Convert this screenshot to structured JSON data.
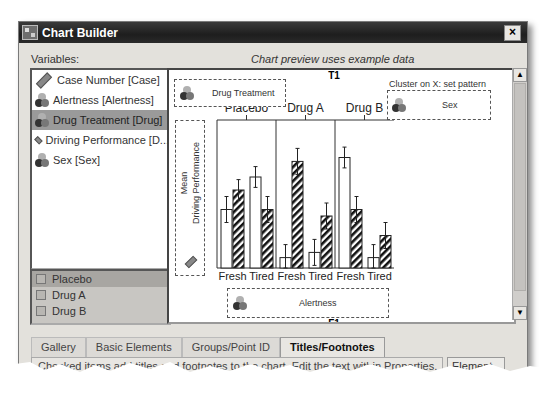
{
  "window": {
    "title": "Chart Builder",
    "close_label": "×"
  },
  "variables": {
    "label": "Variables:",
    "items": [
      {
        "label": "Case Number [Case]",
        "icon": "scale-ruler-icon",
        "selected": false
      },
      {
        "label": "Alertness [Alertness]",
        "icon": "nominal-icon",
        "selected": false
      },
      {
        "label": "Drug Treatment [Drug]",
        "icon": "nominal-icon",
        "selected": true
      },
      {
        "label": "Driving Performance [D...",
        "icon": "scale-ruler-icon",
        "selected": false
      },
      {
        "label": "Sex [Sex]",
        "icon": "nominal-icon",
        "selected": false
      }
    ]
  },
  "categories": {
    "items": [
      "Placebo",
      "Drug A",
      "Drug B"
    ]
  },
  "preview": {
    "note": "Chart preview uses example data",
    "title_marker": "T1",
    "footnote_marker": "F1",
    "panel_dropzone": "Drug Treatment",
    "cluster_label": "Cluster on X: set pattern",
    "cluster_dropzone": "Sex",
    "y_dropzone_line1": "Mean",
    "y_dropzone_line2": "Driving Performance",
    "x_dropzone": "Alertness"
  },
  "chart_data": {
    "type": "bar",
    "title": "",
    "panels": [
      "Placebo",
      "Drug A",
      "Drug B"
    ],
    "categories": [
      "Fresh",
      "Tired"
    ],
    "xlabel": "Alertness",
    "ylabel": "Mean Driving Performance",
    "series": [
      {
        "name": "Sex (group 1, white)",
        "pattern": "plain",
        "values": {
          "Placebo": [
            0.45,
            0.7
          ],
          "Drug A": [
            0.08,
            0.12
          ],
          "Drug B": [
            0.85,
            0.08
          ]
        },
        "errors": [
          0.1,
          0.08,
          0.1,
          0.1,
          0.08,
          0.1
        ]
      },
      {
        "name": "Sex (group 2, hatched)",
        "pattern": "hatched",
        "values": {
          "Placebo": [
            0.6,
            0.45
          ],
          "Drug A": [
            0.82,
            0.4
          ],
          "Drug B": [
            0.45,
            0.25
          ]
        },
        "errors": [
          0.08,
          0.1,
          0.1,
          0.1,
          0.1,
          0.1
        ]
      }
    ],
    "ylim": [
      0,
      1
    ],
    "grid": false,
    "note": "Example data preview; values are relative (no y-axis scale shown)"
  },
  "tabs": [
    {
      "label": "Gallery",
      "active": false
    },
    {
      "label": "Basic Elements",
      "active": false
    },
    {
      "label": "Groups/Point ID",
      "active": false
    },
    {
      "label": "Titles/Footnotes",
      "active": true
    }
  ],
  "tab_panel": {
    "text": "Checked items add titles and footnotes to the chart. Edit the text within Properties."
  },
  "element_button": "Element"
}
